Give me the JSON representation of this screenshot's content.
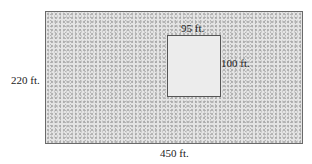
{
  "diagram": {
    "outer_rectangle": {
      "width_label": "450 ft.",
      "height_label": "220 ft."
    },
    "inner_rectangle": {
      "width_label": "95 ft.",
      "height_label": "100 ft."
    }
  }
}
